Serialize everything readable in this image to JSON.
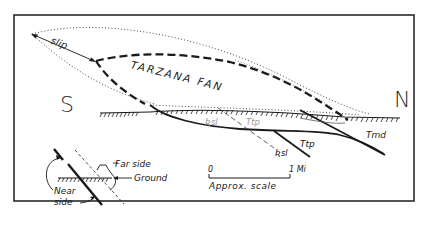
{
  "diagram": {
    "title": "",
    "compass": {
      "south": "S",
      "north": "N"
    },
    "labels": {
      "slip": "slip",
      "fan": "TARZANA FAN",
      "rsl_upper": "Ʀsl",
      "ttp_upper": "Ttp",
      "rsl_lower": "Ʀsl",
      "ttp_lower": "Ttp",
      "tmd": "Tmd"
    },
    "legend": {
      "far_side": "Far side",
      "ground": "Ground",
      "near_side_line1": "Near",
      "near_side_line2": "side"
    },
    "scale": {
      "start": "0",
      "end": "1 Mi",
      "caption": "Approx. scale"
    },
    "colors": {
      "ink": "#1a1a1a",
      "faint_ink": "#9a9a9a",
      "background": "#ffffff"
    }
  }
}
